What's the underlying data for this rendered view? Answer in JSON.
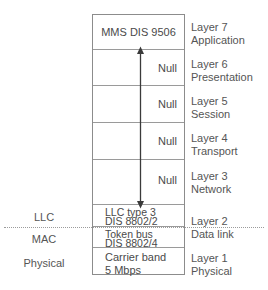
{
  "diagram": {
    "arrow": {
      "name": "null-layers-span-arrow",
      "style": "double-headed-vertical"
    },
    "separator": {
      "name": "llc-mac-dotted-divider",
      "style": "dotted"
    }
  },
  "left_labels": [
    {
      "id": "llc",
      "text": "LLC"
    },
    {
      "id": "mac",
      "text": "MAC"
    },
    {
      "id": "physical",
      "text": "Physical"
    }
  ],
  "right_labels": [
    {
      "id": "layer7",
      "number": "Layer 7",
      "name": "Application"
    },
    {
      "id": "layer6",
      "number": "Layer 6",
      "name": "Presentation"
    },
    {
      "id": "layer5",
      "number": "Layer 5",
      "name": "Session"
    },
    {
      "id": "layer4",
      "number": "Layer 4",
      "name": "Transport"
    },
    {
      "id": "layer3",
      "number": "Layer 3",
      "name": "Network"
    },
    {
      "id": "layer2",
      "number": "Layer 2",
      "name": "Data link"
    },
    {
      "id": "layer1",
      "number": "Layer 1",
      "name": "Physical"
    }
  ],
  "stack_rows": [
    {
      "id": "application",
      "line1": "MMS DIS 9506",
      "line2": ""
    },
    {
      "id": "presentation",
      "line1": "Null",
      "line2": ""
    },
    {
      "id": "session",
      "line1": "Null",
      "line2": ""
    },
    {
      "id": "transport",
      "line1": "Null",
      "line2": ""
    },
    {
      "id": "network",
      "line1": "Null",
      "line2": ""
    },
    {
      "id": "llc",
      "line1": "LLC type 3",
      "line2": "DIS 8802/2"
    },
    {
      "id": "mac",
      "line1": "Token bus",
      "line2": "DIS 8802/4"
    },
    {
      "id": "physical",
      "line1": "Carrier band",
      "line2": "5 Mbps"
    }
  ],
  "colors": {
    "background": "#ffffff",
    "box_border": "#8c8c8c",
    "row_divider": "#9a9a9a",
    "text": "#4a4a4a",
    "label_text": "#555555",
    "arrow": "#3a3a3a",
    "dotted_line": "#9b9b9b"
  }
}
